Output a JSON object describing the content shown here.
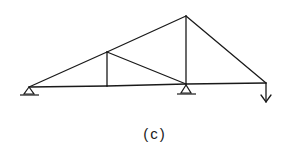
{
  "figure": {
    "caption": "(c)",
    "type": "truss",
    "colors": {
      "line": "#1a1a1a",
      "background": "#ffffff"
    }
  },
  "truss": {
    "nodes": {
      "A": [
        29,
        87
      ],
      "B": [
        107,
        86
      ],
      "C": [
        107,
        52
      ],
      "D": [
        186,
        84
      ],
      "E": [
        186,
        16
      ],
      "F": [
        266,
        83
      ]
    },
    "members": [
      [
        "A",
        "B"
      ],
      [
        "B",
        "D"
      ],
      [
        "D",
        "F"
      ],
      [
        "A",
        "C"
      ],
      [
        "C",
        "E"
      ],
      [
        "E",
        "F"
      ],
      [
        "B",
        "C"
      ],
      [
        "C",
        "D"
      ],
      [
        "D",
        "E"
      ]
    ],
    "supports": [
      {
        "node": "A",
        "kind": "pin"
      },
      {
        "node": "D",
        "kind": "pin"
      }
    ],
    "loads": [
      {
        "node": "F",
        "direction": "down"
      }
    ]
  }
}
